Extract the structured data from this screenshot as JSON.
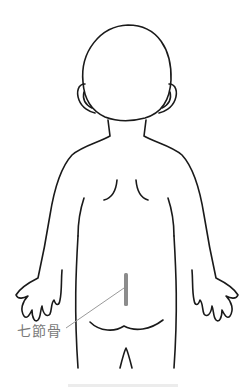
{
  "diagram": {
    "annotation": {
      "label": "七節骨",
      "line_color": "#9a9a9a",
      "marker_color": "#8c8c8c"
    },
    "outline_color": "#1a1a1a",
    "background": "#ffffff"
  }
}
